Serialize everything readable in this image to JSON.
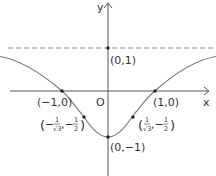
{
  "diagram": {
    "function": "y = (x^2 - 1)/(x^2 + 1)",
    "axes": {
      "x_label": "x",
      "y_label": "y",
      "origin_label": "O"
    },
    "asymptote": {
      "y": 1,
      "style": "dashed"
    },
    "points": [
      {
        "name": "y-intercept-asymptote",
        "label": "(0,1)",
        "x": 0,
        "y": 1
      },
      {
        "name": "root-left",
        "label": "(−1,0)",
        "x": -1,
        "y": 0
      },
      {
        "name": "root-right",
        "label": "(1,0)",
        "x": 1,
        "y": 0
      },
      {
        "name": "minimum",
        "label": "(0,−1)",
        "x": 0,
        "y": -1
      },
      {
        "name": "inflection-left",
        "label_prefix": "(−",
        "num": "1",
        "den": "√3",
        "sep": ",−",
        "num2": "1",
        "den2": "2",
        "suffix": ")",
        "x": -0.577,
        "y": -0.5
      },
      {
        "name": "inflection-right",
        "label_prefix": "(",
        "num": "1",
        "den": "√3",
        "sep": ",−",
        "num2": "1",
        "den2": "2",
        "suffix": ")",
        "x": 0.577,
        "y": -0.5
      }
    ],
    "colors": {
      "curve": "#777777",
      "axis": "#555555",
      "dashed": "#888888",
      "point": "#222222",
      "text": "#333333"
    }
  }
}
